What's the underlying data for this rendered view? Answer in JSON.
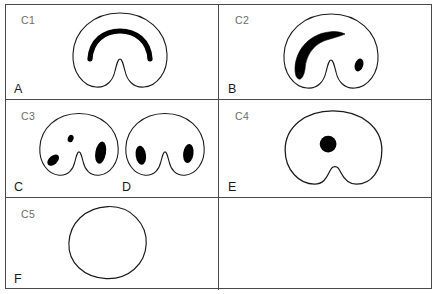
{
  "figure": {
    "type": "line-drawing-panel-grid",
    "columns": 2,
    "rows": 3,
    "background_color": "#ffffff",
    "outline_color": "#1a1a1a",
    "fill_color": "#000000",
    "border_color": "#4a4a4a",
    "code_label_color": "#6c6c6c",
    "panel_label_color": "#1a1a1a"
  },
  "panels": [
    {
      "code": "C1",
      "label": "A",
      "shape": "kidney-outline",
      "marking": "thin-arc-band",
      "description": "Kidney shaped outline with a single thin black arc band in the upper centre"
    },
    {
      "code": "C2",
      "label": "B",
      "shape": "kidney-outline",
      "marking": "thick-hook-band-plus-spot",
      "description": "Kidney shaped outline with a thick tapered hook band on the left and a small teardrop spot on the right"
    },
    {
      "code": "C3",
      "label": "C",
      "shape": "kidney-outline",
      "marking": "three-spots",
      "description": "Kidney shaped outline with a small dot top centre, a slanted spot lower left and a large vertical spot on the right"
    },
    {
      "code": "C3",
      "label": "D",
      "shape": "kidney-outline",
      "marking": "two-symmetric-spots",
      "description": "Kidney shaped outline with two matching oval spots either side of the notch"
    },
    {
      "code": "C4",
      "label": "E",
      "shape": "rounded-kidney-outline",
      "marking": "single-round-dot",
      "description": "Rounded kidney outline with a shallow notch and one round black dot near the centre"
    },
    {
      "code": "C5",
      "label": "F",
      "shape": "plain-circle-outline",
      "marking": "none",
      "description": "Plain irregular circle outline with no internal marking"
    },
    {
      "code": "",
      "label": "",
      "shape": "empty",
      "marking": "none",
      "description": "Empty cell"
    }
  ]
}
